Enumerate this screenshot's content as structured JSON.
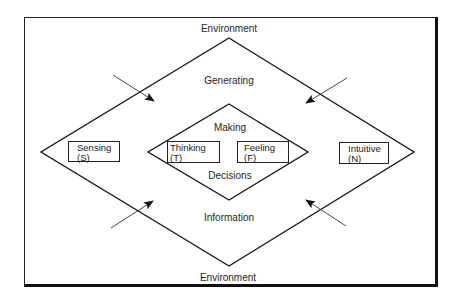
{
  "diagram": {
    "labels": {
      "environment_top": "Environment",
      "generating": "Generating",
      "making": "Making",
      "decisions": "Decisions",
      "information": "Information",
      "environment_bottom": "Environment"
    },
    "boxes": {
      "sensing": {
        "name": "Sensing",
        "code": "(S)"
      },
      "thinking": {
        "name": "Thinking",
        "code": "(T)"
      },
      "feeling": {
        "name": "Feeling",
        "code": "(F)"
      },
      "intuitive": {
        "name": "Intuitive",
        "code": "(N)"
      }
    },
    "arrows": [
      {
        "from": "top-left",
        "direction": "inward"
      },
      {
        "from": "top-right",
        "direction": "inward"
      },
      {
        "from": "bottom-left",
        "direction": "inward"
      },
      {
        "from": "bottom-right",
        "direction": "inward"
      }
    ],
    "colors": {
      "line": "#1a1a1a",
      "background": "#ffffff"
    }
  }
}
